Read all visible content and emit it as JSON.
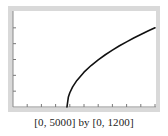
{
  "colors": {
    "frame": "#d9d9d9",
    "plot_background": "#ffffff",
    "axis": "#8a8a8a",
    "tick": "#7a7a7a",
    "curve": "#111111",
    "caption": "#222222"
  },
  "caption": "[0, 5000] by [0, 1200]",
  "chart_data": {
    "type": "line",
    "title": "",
    "subtitle": "",
    "xlabel": "",
    "ylabel": "",
    "xlim": [
      0,
      5000
    ],
    "ylim": [
      0,
      1200
    ],
    "x_ticks_count": 10,
    "x_tick_spacing": 500,
    "y_ticks_count": 6,
    "y_tick_spacing": 200,
    "tick_labels_shown": false,
    "grid": false,
    "legend": null,
    "annotation": "[0, 5000] by [0, 1200]",
    "series": [
      {
        "name": "curve",
        "description": "square-root shaped curve; approximate model y = 17.96 * sqrt(x - 1900), with start point and coefficient estimated from pixels",
        "x": [
          1900,
          1950,
          2000,
          2100,
          2250,
          2500,
          2750,
          3000,
          3250,
          3500,
          3750,
          4000,
          4250,
          4500,
          4750,
          5000
        ],
        "y": [
          0,
          127,
          180,
          254,
          336,
          440,
          524,
          596,
          660,
          718,
          773,
          823,
          871,
          916,
          959,
          1000
        ]
      }
    ]
  }
}
